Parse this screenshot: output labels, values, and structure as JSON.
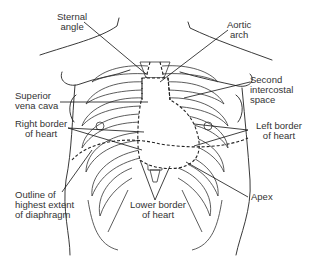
{
  "figure": {
    "labels": {
      "sternal_angle": [
        "Sternal",
        "angle"
      ],
      "aortic_arch": [
        "Aortic",
        "arch"
      ],
      "superior_vena_cava": [
        "Superior",
        "vena cava"
      ],
      "second_intercostal_space": [
        "Second",
        "intercostal",
        "space"
      ],
      "right_border_of_heart": [
        "Right border",
        "of heart"
      ],
      "left_border_of_heart": [
        "Left border",
        "of heart"
      ],
      "outline_of_diaphragm": [
        "Outline of",
        "highest extent",
        "of diaphragm"
      ],
      "lower_border_of_heart": [
        "Lower border",
        "of heart"
      ],
      "apex": [
        "Apex"
      ]
    },
    "colors": {
      "line": "#222222",
      "text": "#333333",
      "background": "#ffffff"
    }
  }
}
